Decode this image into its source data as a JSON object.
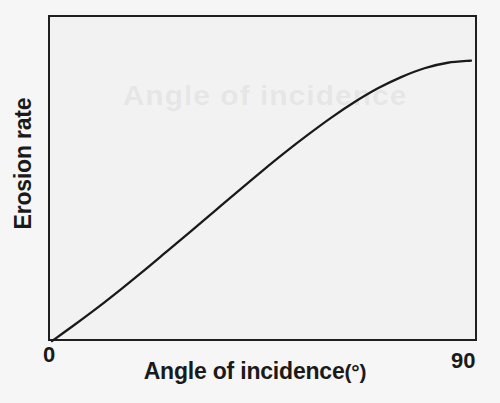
{
  "figure": {
    "kind": "scanned-line-graph",
    "background_color": "#f6f6f6",
    "plot_background_color": "#f2f2f2",
    "ink_color": "#1a1a1a",
    "ghost_text": "Angle of incidence"
  },
  "axes": {
    "y_title": "Erosion rate",
    "x_title": "Angle of incidence",
    "x_unit": "(°)",
    "x_tick_min": "0",
    "x_tick_max": "90"
  },
  "chart_data": {
    "type": "line",
    "title": "",
    "subtitle": "",
    "xlabel": "Angle of incidence (°)",
    "ylabel": "Erosion rate",
    "xlim": [
      0,
      90
    ],
    "ylim": [
      0,
      1.05
    ],
    "grid": false,
    "legend": "none",
    "x_ticks": [
      0,
      90
    ],
    "x_tick_labels": [
      "0",
      "90"
    ],
    "y_ticks": [],
    "y_tick_labels": [],
    "annotations": [],
    "series": [
      {
        "name": "Erosion rate",
        "style": "solid",
        "color": "#1a1a1a",
        "x": [
          0,
          5,
          10,
          15,
          20,
          25,
          30,
          35,
          40,
          45,
          50,
          55,
          60,
          65,
          70,
          75,
          80,
          85,
          90
        ],
        "y": [
          0.0,
          0.055,
          0.112,
          0.172,
          0.234,
          0.298,
          0.362,
          0.427,
          0.492,
          0.556,
          0.618,
          0.677,
          0.733,
          0.784,
          0.829,
          0.866,
          0.895,
          0.913,
          0.92
        ]
      }
    ]
  }
}
